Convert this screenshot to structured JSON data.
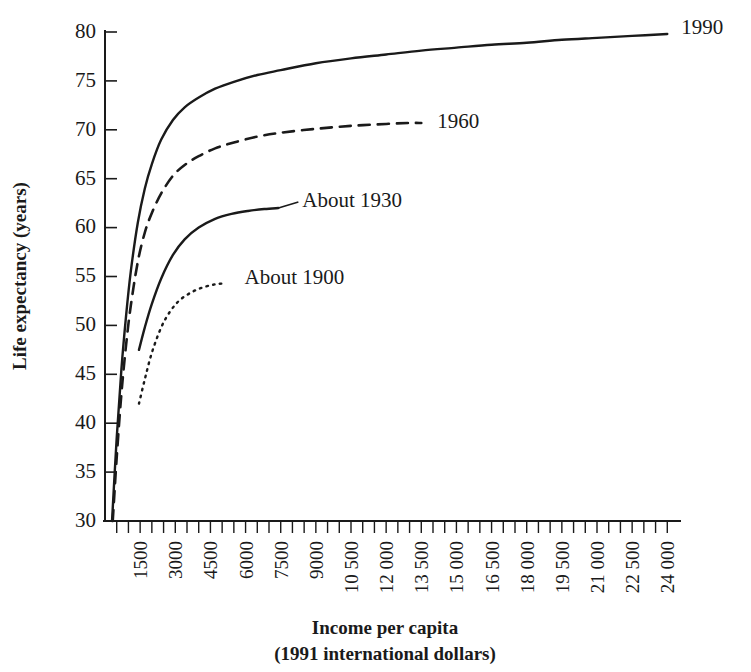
{
  "chart_data": {
    "type": "line",
    "title": "",
    "xlabel": "Income per capita",
    "xlabel_sub": "(1991 international dollars)",
    "ylabel": "Life expectancy (years)",
    "xlim": [
      0,
      24500
    ],
    "ylim": [
      30,
      80
    ],
    "grid": false,
    "legend_position": "inline-curve-labels",
    "x_tick_labels": [
      "1500",
      "3000",
      "4500",
      "6000",
      "7500",
      "9000",
      "10 500",
      "12 000",
      "13 500",
      "15 000",
      "16 500",
      "18 000",
      "19 500",
      "21 000",
      "22 500",
      "24 000"
    ],
    "x_tick_values": [
      1500,
      3000,
      4500,
      6000,
      7500,
      9000,
      10500,
      12000,
      13500,
      15000,
      16500,
      18000,
      19500,
      21000,
      22500,
      24000
    ],
    "x_minor_step": 500,
    "y_tick_labels": [
      "30",
      "35",
      "40",
      "45",
      "50",
      "55",
      "60",
      "65",
      "70",
      "75",
      "80"
    ],
    "y_tick_values": [
      30,
      35,
      40,
      45,
      50,
      55,
      60,
      65,
      70,
      75,
      80
    ],
    "series": [
      {
        "name": "1990",
        "label": "1990",
        "style": "solid",
        "color": "#1a1a1a",
        "x": [
          300,
          500,
          700,
          900,
          1100,
          1400,
          1700,
          2000,
          2400,
          2900,
          3400,
          4000,
          4700,
          5500,
          6500,
          7500,
          9000,
          10500,
          12000,
          13500,
          15000,
          16500,
          18000,
          19500,
          21000,
          22500,
          24000
        ],
        "y": [
          30.0,
          38.5,
          45.5,
          51.0,
          55.5,
          60.5,
          64.0,
          66.5,
          69.0,
          71.0,
          72.3,
          73.3,
          74.2,
          74.9,
          75.6,
          76.1,
          76.8,
          77.3,
          77.7,
          78.1,
          78.4,
          78.7,
          78.9,
          79.2,
          79.4,
          79.6,
          79.8
        ]
      },
      {
        "name": "1960",
        "label": "1960",
        "style": "dashed",
        "color": "#1a1a1a",
        "x": [
          330,
          500,
          700,
          900,
          1100,
          1400,
          1700,
          2000,
          2400,
          2900,
          3400,
          4000,
          4700,
          5500,
          6500,
          7500,
          9000,
          10500,
          12000,
          13000,
          13500
        ],
        "y": [
          30.0,
          36.5,
          43.0,
          48.0,
          52.0,
          56.5,
          59.5,
          61.5,
          63.5,
          65.3,
          66.4,
          67.3,
          68.1,
          68.7,
          69.3,
          69.7,
          70.1,
          70.4,
          70.6,
          70.7,
          70.7
        ]
      },
      {
        "name": "About 1930",
        "label": "About 1930",
        "style": "solid",
        "color": "#1a1a1a",
        "x": [
          1450,
          1700,
          2000,
          2400,
          2900,
          3400,
          4000,
          4700,
          5400,
          6100,
          6800,
          7400
        ],
        "y": [
          47.5,
          49.8,
          52.2,
          54.8,
          57.2,
          58.8,
          60.0,
          60.9,
          61.4,
          61.7,
          61.9,
          62.0
        ]
      },
      {
        "name": "About 1900",
        "label": "About 1900",
        "style": "dotted",
        "color": "#1a1a1a",
        "x": [
          1450,
          1700,
          2000,
          2400,
          2800,
          3200,
          3700,
          4200,
          4700,
          5100
        ],
        "y": [
          42.0,
          44.5,
          47.2,
          49.8,
          51.5,
          52.6,
          53.4,
          53.9,
          54.2,
          54.3
        ]
      }
    ],
    "annotations": [
      {
        "text": "1990",
        "anchor_x": 24000,
        "anchor_y": 79.8,
        "leader": false
      },
      {
        "text": "1960",
        "anchor_x": 13500,
        "anchor_y": 70.7,
        "leader": false
      },
      {
        "text": "About 1930",
        "anchor_x": 7400,
        "anchor_y": 62.0,
        "leader": true
      },
      {
        "text": "About 1900",
        "anchor_x": 5100,
        "anchor_y": 54.3,
        "leader": false
      }
    ]
  }
}
